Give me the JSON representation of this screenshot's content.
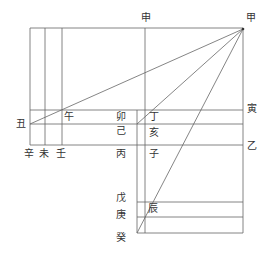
{
  "diagram": {
    "labels": {
      "jia": "甲",
      "shen": "申",
      "chou": "丑",
      "wu_noon": "午",
      "mao": "卯",
      "ji": "己",
      "bing": "丙",
      "ding": "丁",
      "hai": "亥",
      "zi": "子",
      "yin": "寅",
      "yi": "乙",
      "xin": "辛",
      "wei": "未",
      "ren": "壬",
      "wu_earth": "戊",
      "geng": "庚",
      "gui": "癸",
      "chen": "辰"
    },
    "line_color": "#666666",
    "text_color": "#333333"
  }
}
